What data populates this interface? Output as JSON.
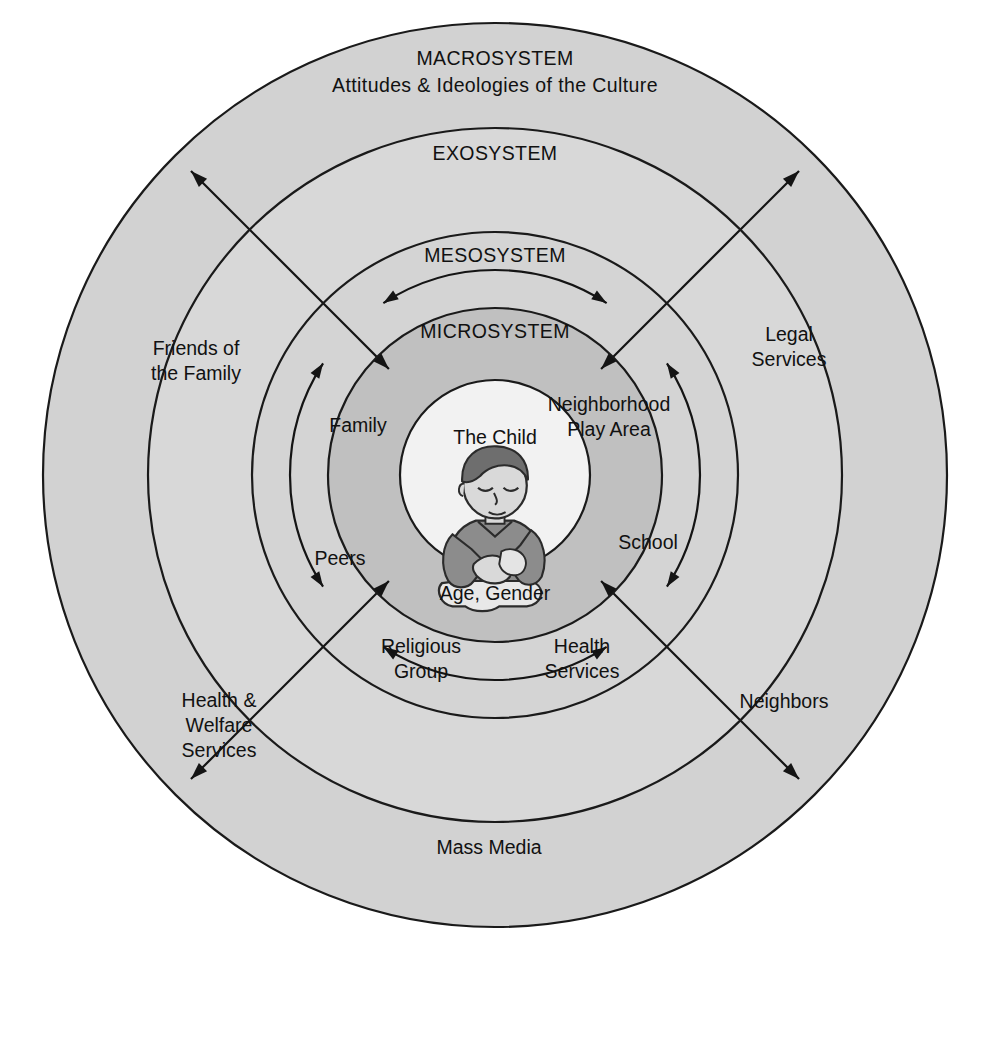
{
  "figure": {
    "kind": "concentric-rings-diagram",
    "center": {
      "x": 495,
      "y": 475
    }
  },
  "colors": {
    "page_background": "#ffffff",
    "macrosystem_fill": "#d2d2d2",
    "exosystem_fill": "#d8d8d8",
    "mesosystem_fill": "#d4d4d4",
    "microsystem_fill": "#c0c0c0",
    "center_fill": "#f2f2f2",
    "stroke": "#1a1a1a",
    "text": "#111111",
    "child_hair": "#6e6e6e",
    "child_shirt": "#8c8c8c",
    "child_skin": "#d9d9d9",
    "child_pants": "#e8e8e8"
  },
  "rings": [
    {
      "id": "macrosystem",
      "title": "MACROSYSTEM",
      "subtitle": "Attitudes & Ideologies of the Culture",
      "outer_radius": 452,
      "inner_radius": 347
    },
    {
      "id": "exosystem",
      "title": "EXOSYSTEM",
      "subtitle": "",
      "outer_radius": 347,
      "inner_radius": 243
    },
    {
      "id": "mesosystem",
      "title": "MESOSYSTEM",
      "subtitle": "",
      "outer_radius": 243,
      "inner_radius": 167
    },
    {
      "id": "microsystem",
      "title": "MICROSYSTEM",
      "subtitle": "",
      "outer_radius": 167,
      "inner_radius": 95
    }
  ],
  "center": {
    "id": "the-child",
    "radius": 95,
    "top_label": "The Child",
    "bottom_label": "Age, Gender",
    "illustration": "child-figure-icon"
  },
  "microsystem_nodes": [
    {
      "id": "family",
      "label": "Family",
      "x": 358,
      "y": 427
    },
    {
      "id": "neighborhood-play-area",
      "label": "Neighborhood\nPlay Area",
      "x": 609,
      "y": 418
    },
    {
      "id": "school",
      "label": "School",
      "x": 648,
      "y": 544
    },
    {
      "id": "health-services",
      "label": "Health\nServices",
      "x": 582,
      "y": 660
    },
    {
      "id": "religious-group",
      "label": "Religious\nGroup",
      "x": 421,
      "y": 660
    },
    {
      "id": "peers",
      "label": "Peers",
      "x": 340,
      "y": 560
    }
  ],
  "exosystem_nodes": [
    {
      "id": "friends-of-the-family",
      "label": "Friends of\nthe Family",
      "x": 196,
      "y": 362
    },
    {
      "id": "legal-services",
      "label": "Legal\nServices",
      "x": 789,
      "y": 348
    },
    {
      "id": "neighbors",
      "label": "Neighbors",
      "x": 784,
      "y": 703
    },
    {
      "id": "health-welfare-services",
      "label": "Health &\nWelfare\nServices",
      "x": 219,
      "y": 727
    },
    {
      "id": "mass-media",
      "label": "Mass Media",
      "x": 489,
      "y": 849
    }
  ],
  "mesosystem_arrows": {
    "count": 4,
    "style": "double-headed-arc",
    "positions": [
      "top",
      "right",
      "bottom",
      "left"
    ],
    "radius": 205
  },
  "radial_arrows": {
    "count": 4,
    "style": "double-headed-straight",
    "note": "diagonal arrows crossing all rings from microsystem outward",
    "angles_deg": [
      225,
      315,
      45,
      135
    ]
  },
  "background_page_text": [
    "and responses. The teacher who is most comfortable working with",
    "a child who is quiet and attentive may be frustrated with a child",
    "who is eager to show new knowledge. They will likely encourage",
    "pupils in a sector essential phase of the new will achieve the",
    "other to complete a pattern. Children acquire skills and make the",
    "ability to also the reward of Children for their years. In the theory",
    "the interactions among settings that contain the developing",
    "The exosystem consists of settings in which the child is not",
    "an active participant but which nevertheless affect the child",
    "Attitudes and ideologies of the culture form the outermost",
    "layer, the macrosystem, which influences all the other layers"
  ]
}
